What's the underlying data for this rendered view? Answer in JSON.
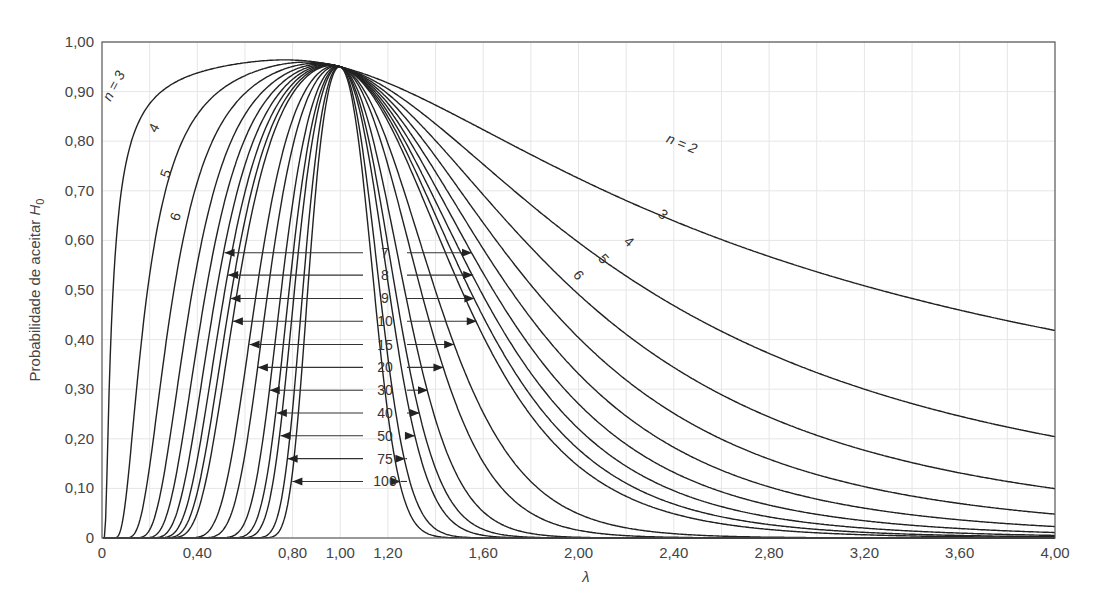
{
  "chart_data": {
    "type": "line",
    "title": "",
    "xlabel": "λ",
    "ylabel": "Probabilidade de aceitar H0",
    "ylabel_main": "Probabilidade de aceitar ",
    "ylabel_var": "H",
    "ylabel_sub": "0",
    "xlim": [
      0,
      4.0
    ],
    "ylim": [
      0,
      1.0
    ],
    "grid": true,
    "x_ticks": [
      "0",
      "0,40",
      "0,80",
      "1,00",
      "1,20",
      "1,60",
      "2,00",
      "2,40",
      "2,80",
      "3,20",
      "3,60",
      "4,00"
    ],
    "x_tick_values": [
      0,
      0.4,
      0.8,
      1.0,
      1.2,
      1.6,
      2.0,
      2.4,
      2.8,
      3.2,
      3.6,
      4.0
    ],
    "y_ticks": [
      "0",
      "0,10",
      "0,20",
      "0,30",
      "0,40",
      "0,50",
      "0,60",
      "0,70",
      "0,80",
      "0,90",
      "1,00"
    ],
    "y_tick_values": [
      0,
      0.1,
      0.2,
      0.3,
      0.4,
      0.5,
      0.6,
      0.7,
      0.8,
      0.9,
      1.0
    ],
    "alpha": 0.05,
    "series_n": [
      2,
      3,
      4,
      5,
      6,
      7,
      8,
      9,
      10,
      15,
      20,
      30,
      40,
      50,
      75,
      100
    ],
    "series": [
      {
        "name": "n = 2",
        "n": 2,
        "value_at_lambda_4": 0.52
      },
      {
        "name": "n = 3",
        "n": 3,
        "value_at_lambda_4": 0.31
      },
      {
        "name": "n = 4",
        "n": 4,
        "value_at_lambda_4": 0.18
      },
      {
        "name": "n = 5",
        "n": 5,
        "value_at_lambda_4": 0.11
      },
      {
        "name": "n = 6",
        "n": 6,
        "value_at_lambda_4": 0.07
      },
      {
        "name": "n = 7",
        "n": 7,
        "value_at_lambda_4": 0.05
      },
      {
        "name": "n = 8",
        "n": 8,
        "value_at_lambda_4": 0.03
      },
      {
        "name": "n = 9",
        "n": 9,
        "value_at_lambda_4": 0.02
      },
      {
        "name": "n = 10",
        "n": 10,
        "value_at_lambda_4": 0.01
      },
      {
        "name": "n = 15",
        "n": 15,
        "value_at_lambda_4": 0.0
      },
      {
        "name": "n = 20",
        "n": 20,
        "value_at_lambda_4": 0.0
      },
      {
        "name": "n = 30",
        "n": 30,
        "value_at_lambda_4": 0.0
      },
      {
        "name": "n = 40",
        "n": 40,
        "value_at_lambda_4": 0.0
      },
      {
        "name": "n = 50",
        "n": 50,
        "value_at_lambda_4": 0.0
      },
      {
        "name": "n = 75",
        "n": 75,
        "value_at_lambda_4": 0.0
      },
      {
        "name": "n = 100",
        "n": 100,
        "value_at_lambda_4": 0.0
      }
    ],
    "annotations": {
      "left_labels": [
        {
          "text": "n = 3",
          "n": 3
        },
        {
          "text": "4",
          "n": 4
        },
        {
          "text": "5",
          "n": 5
        },
        {
          "text": "6",
          "n": 6
        }
      ],
      "right_labels": [
        {
          "text": "n = 2",
          "n": 2
        },
        {
          "text": "3",
          "n": 3
        },
        {
          "text": "4",
          "n": 4
        },
        {
          "text": "5",
          "n": 5
        },
        {
          "text": "6",
          "n": 6
        }
      ],
      "arrow_labels": [
        {
          "text": "7",
          "n": 7,
          "y": 0.575
        },
        {
          "text": "8",
          "n": 8,
          "y": 0.53
        },
        {
          "text": "9",
          "n": 9,
          "y": 0.483
        },
        {
          "text": "10",
          "n": 10,
          "y": 0.437
        },
        {
          "text": "15",
          "n": 15,
          "y": 0.39
        },
        {
          "text": "20",
          "n": 20,
          "y": 0.344
        },
        {
          "text": "30",
          "n": 30,
          "y": 0.298
        },
        {
          "text": "40",
          "n": 40,
          "y": 0.252
        },
        {
          "text": "50",
          "n": 50,
          "y": 0.206
        },
        {
          "text": "75",
          "n": 75,
          "y": 0.16
        },
        {
          "text": "100",
          "n": 100,
          "y": 0.114
        }
      ]
    }
  },
  "caption": {
    "partial_text": "probabilidade de aceitar H0"
  }
}
